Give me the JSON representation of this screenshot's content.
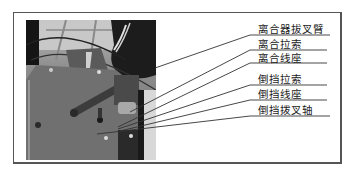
{
  "figure": {
    "type": "labeled-photo-diagram",
    "photo_description": "grayscale photo of clutch and reverse gear cable mechanism",
    "labels": [
      {
        "text": "离合器拔叉臂",
        "x": 258,
        "y": 23,
        "underline_y": 35,
        "target": [
          155,
          68
        ]
      },
      {
        "text": "离合拉索",
        "x": 258,
        "y": 38,
        "underline_y": 50,
        "target": [
          130,
          112
        ]
      },
      {
        "text": "离合线座",
        "x": 258,
        "y": 52,
        "underline_y": 63,
        "target": [
          118,
          127
        ]
      },
      {
        "text": "倒挡拉索",
        "x": 258,
        "y": 73,
        "underline_y": 85,
        "target": [
          118,
          129
        ]
      },
      {
        "text": "倒挡线座",
        "x": 258,
        "y": 88,
        "underline_y": 100,
        "target": [
          120,
          131
        ]
      },
      {
        "text": "倒挡拨叉轴",
        "x": 258,
        "y": 104,
        "underline_y": 116,
        "target": [
          97,
          134
        ]
      }
    ]
  }
}
